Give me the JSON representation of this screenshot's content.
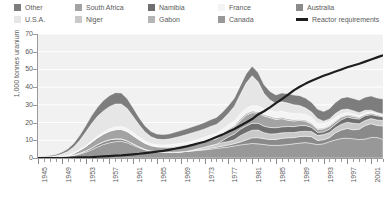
{
  "legend": {
    "entries": [
      {
        "label": "Other",
        "color": "#7d7d7d",
        "type": "swatch",
        "col": 0,
        "row": 0
      },
      {
        "label": "U.S.A.",
        "color": "#e6e6e6",
        "type": "swatch",
        "col": 0,
        "row": 1
      },
      {
        "label": "South Africa",
        "color": "#a3a3a3",
        "type": "swatch",
        "col": 1,
        "row": 0
      },
      {
        "label": "Niger",
        "color": "#c9c9c9",
        "type": "swatch",
        "col": 1,
        "row": 1
      },
      {
        "label": "Namibia",
        "color": "#6f6f6f",
        "type": "swatch",
        "col": 2,
        "row": 0
      },
      {
        "label": "Gabon",
        "color": "#b5b5b5",
        "type": "swatch",
        "col": 2,
        "row": 1
      },
      {
        "label": "France",
        "color": "#f4f4f4",
        "type": "swatch",
        "col": 3,
        "row": 0
      },
      {
        "label": "Canada",
        "color": "#989898",
        "type": "swatch",
        "col": 3,
        "row": 1
      },
      {
        "label": "Australia",
        "color": "#8a8a8a",
        "type": "swatch",
        "col": 4,
        "row": 0
      },
      {
        "label": "Reactor requirements",
        "color": "#1d1d1d",
        "type": "line",
        "col": 4,
        "row": 1
      }
    ]
  },
  "chart_data": {
    "type": "area",
    "title": "",
    "xlabel": "",
    "ylabel": "1,000 tonnes uranium",
    "stacked": true,
    "grid": true,
    "legend_position": "top",
    "xlim": [
      1945,
      2003
    ],
    "ylim": [
      0,
      70
    ],
    "yticks": [
      0,
      10,
      20,
      30,
      40,
      50,
      60,
      70
    ],
    "ytick_labels": [
      "0",
      "10",
      "20",
      "30",
      "40",
      "50",
      "60",
      "70"
    ],
    "xticks": [
      1945,
      1949,
      1953,
      1957,
      1961,
      1965,
      1969,
      1973,
      1977,
      1981,
      1985,
      1989,
      1993,
      1997,
      2001
    ],
    "xtick_labels": [
      "1945",
      "1949",
      "1953",
      "1957",
      "1961",
      "1965",
      "1969",
      "1973",
      "1977",
      "1981",
      "1985",
      "1989",
      "1993",
      "1997",
      "2001"
    ],
    "x": [
      1945,
      1946,
      1947,
      1948,
      1949,
      1950,
      1951,
      1952,
      1953,
      1954,
      1955,
      1956,
      1957,
      1958,
      1959,
      1960,
      1961,
      1962,
      1963,
      1964,
      1965,
      1966,
      1967,
      1968,
      1969,
      1970,
      1971,
      1972,
      1973,
      1974,
      1975,
      1976,
      1977,
      1978,
      1979,
      1980,
      1981,
      1982,
      1983,
      1984,
      1985,
      1986,
      1987,
      1988,
      1989,
      1990,
      1991,
      1992,
      1993,
      1994,
      1995,
      1996,
      1997,
      1998,
      1999,
      2000,
      2001,
      2002,
      2003
    ],
    "series": [
      {
        "name": "Canada",
        "color": "#989898",
        "values": [
          0.1,
          0.2,
          0.3,
          0.4,
          0.6,
          0.9,
          1.4,
          2.2,
          3.2,
          4.6,
          6.2,
          7.6,
          8.6,
          9.2,
          9.4,
          8.6,
          7.2,
          5.8,
          4.6,
          3.8,
          3.4,
          3.2,
          3.1,
          3.2,
          3.4,
          3.7,
          4.0,
          4.3,
          4.6,
          5.0,
          5.4,
          5.8,
          6.2,
          6.8,
          7.4,
          7.8,
          8.2,
          8.0,
          7.6,
          7.2,
          7.1,
          7.3,
          7.6,
          8.0,
          8.4,
          8.7,
          8.2,
          7.6,
          8.0,
          9.2,
          10.2,
          11.0,
          11.2,
          10.9,
          10.4,
          10.7,
          11.6,
          11.6,
          10.5
        ]
      },
      {
        "name": "Australia",
        "color": "#8a8a8a",
        "values": [
          0.0,
          0.0,
          0.0,
          0.0,
          0.1,
          0.2,
          0.3,
          0.5,
          0.8,
          1.1,
          1.4,
          1.6,
          1.7,
          1.6,
          1.4,
          1.1,
          0.8,
          0.5,
          0.3,
          0.2,
          0.1,
          0.1,
          0.1,
          0.1,
          0.1,
          0.1,
          0.1,
          0.2,
          0.3,
          0.5,
          0.7,
          0.9,
          1.1,
          1.3,
          1.6,
          2.4,
          3.2,
          3.5,
          3.3,
          3.2,
          3.4,
          3.8,
          3.8,
          3.5,
          3.7,
          3.6,
          3.8,
          2.3,
          2.3,
          2.3,
          4.0,
          4.8,
          5.5,
          5.0,
          5.9,
          7.6,
          7.8,
          6.8,
          7.6
        ]
      },
      {
        "name": "Niger",
        "color": "#c9c9c9",
        "values": [
          0,
          0,
          0,
          0,
          0,
          0,
          0,
          0,
          0,
          0,
          0,
          0,
          0,
          0,
          0,
          0,
          0,
          0,
          0,
          0,
          0,
          0,
          0,
          0,
          0,
          0,
          0.4,
          0.8,
          1.2,
          1.5,
          1.7,
          2.1,
          2.0,
          2.2,
          3.6,
          4.1,
          4.3,
          4.3,
          3.4,
          3.2,
          3.2,
          3.1,
          3.0,
          2.9,
          2.8,
          2.8,
          2.9,
          2.9,
          2.9,
          2.9,
          2.9,
          3.3,
          3.5,
          3.7,
          3.0,
          2.9,
          2.9,
          3.1,
          3.1
        ]
      },
      {
        "name": "Namibia",
        "color": "#6f6f6f",
        "values": [
          0,
          0,
          0,
          0,
          0,
          0,
          0,
          0,
          0,
          0,
          0,
          0,
          0,
          0,
          0,
          0,
          0,
          0,
          0,
          0,
          0,
          0,
          0,
          0,
          0,
          0,
          0,
          0,
          0,
          0,
          0,
          1.0,
          2.6,
          3.2,
          3.6,
          3.8,
          3.9,
          3.8,
          3.7,
          3.6,
          3.4,
          3.4,
          3.4,
          3.3,
          3.4,
          3.2,
          2.4,
          1.7,
          1.5,
          1.9,
          2.0,
          2.5,
          2.9,
          2.8,
          2.7,
          2.7,
          2.2,
          2.3,
          2.0
        ]
      },
      {
        "name": "South Africa",
        "color": "#a3a3a3",
        "values": [
          0,
          0,
          0,
          0,
          0,
          0.2,
          0.8,
          1.6,
          2.4,
          3.2,
          3.8,
          4.3,
          4.8,
          5.2,
          5.4,
          5.2,
          4.6,
          4.0,
          3.4,
          3.0,
          2.8,
          2.8,
          2.8,
          2.9,
          3.0,
          3.1,
          3.2,
          3.2,
          3.2,
          3.1,
          3.0,
          3.2,
          3.4,
          3.9,
          4.8,
          6.1,
          6.0,
          5.8,
          5.7,
          5.6,
          4.6,
          4.6,
          3.5,
          3.2,
          2.9,
          2.5,
          1.8,
          1.7,
          1.7,
          1.6,
          1.4,
          1.4,
          1.1,
          1.0,
          0.9,
          0.8,
          0.9,
          0.8,
          0.7
        ]
      },
      {
        "name": "Gabon",
        "color": "#b5b5b5",
        "values": [
          0,
          0,
          0,
          0,
          0,
          0,
          0,
          0,
          0,
          0,
          0,
          0,
          0,
          0,
          0,
          0,
          0,
          0,
          0,
          0,
          0.1,
          0.2,
          0.4,
          0.5,
          0.5,
          0.5,
          0.5,
          0.5,
          0.6,
          0.8,
          0.9,
          0.9,
          1.0,
          1.0,
          1.1,
          1.0,
          1.0,
          0.9,
          0.9,
          0.9,
          0.9,
          0.9,
          0.9,
          0.9,
          0.7,
          0.7,
          0.7,
          0.6,
          0.6,
          0.6,
          0.6,
          0.5,
          0.5,
          0.7,
          0.3,
          0.2,
          0.2,
          0.0,
          0.0
        ]
      },
      {
        "name": "France",
        "color": "#f4f4f4",
        "values": [
          0,
          0,
          0,
          0,
          0.1,
          0.2,
          0.3,
          0.4,
          0.5,
          0.7,
          0.9,
          1.1,
          1.3,
          1.5,
          1.7,
          1.8,
          1.8,
          1.6,
          1.4,
          1.2,
          1.1,
          1.1,
          1.1,
          1.2,
          1.3,
          1.4,
          1.5,
          1.7,
          1.9,
          2.1,
          2.2,
          2.3,
          2.4,
          2.5,
          2.7,
          2.9,
          3.0,
          3.1,
          3.2,
          3.3,
          3.4,
          3.4,
          3.4,
          3.3,
          3.2,
          3.1,
          3.0,
          2.8,
          2.5,
          2.1,
          1.7,
          1.3,
          1.0,
          0.8,
          0.6,
          0.5,
          0.4,
          0.2,
          0.2
        ]
      },
      {
        "name": "U.S.A.",
        "color": "#e6e6e6",
        "values": [
          0.3,
          0.4,
          0.6,
          0.9,
          1.4,
          2.2,
          3.4,
          5.2,
          7.6,
          9.8,
          11.2,
          12.0,
          12.6,
          13.0,
          12.6,
          11.2,
          9.0,
          6.8,
          5.0,
          3.8,
          3.2,
          3.0,
          3.2,
          3.6,
          4.0,
          4.4,
          4.6,
          4.6,
          4.6,
          4.8,
          5.0,
          5.4,
          6.4,
          8.2,
          11.0,
          14.2,
          16.8,
          13.6,
          8.6,
          5.8,
          4.8,
          5.2,
          5.4,
          5.0,
          4.5,
          3.6,
          3.2,
          2.7,
          1.3,
          1.4,
          2.3,
          2.4,
          2.0,
          1.8,
          1.8,
          1.5,
          1.0,
          0.9,
          0.8
        ]
      },
      {
        "name": "Other",
        "color": "#7d7d7d",
        "values": [
          0.2,
          0.3,
          0.5,
          0.7,
          1.0,
          1.4,
          2.0,
          2.8,
          3.6,
          4.4,
          5.2,
          5.8,
          6.2,
          6.4,
          6.2,
          5.6,
          4.8,
          4.0,
          3.4,
          3.0,
          2.8,
          2.8,
          2.9,
          3.0,
          3.2,
          3.3,
          3.4,
          3.5,
          3.6,
          3.8,
          4.0,
          4.2,
          4.4,
          4.6,
          4.9,
          5.2,
          5.4,
          5.2,
          5.0,
          4.8,
          4.8,
          5.0,
          5.2,
          5.4,
          5.6,
          5.6,
          5.4,
          5.2,
          5.4,
          5.8,
          6.2,
          6.6,
          6.8,
          6.9,
          7.0,
          7.4,
          8.0,
          8.2,
          8.4
        ]
      }
    ],
    "overlay_line": {
      "name": "Reactor requirements",
      "color": "#1d1d1d",
      "width": 2.2,
      "values": [
        0.0,
        0.0,
        0.0,
        0.0,
        0.0,
        0.1,
        0.2,
        0.3,
        0.4,
        0.5,
        0.7,
        0.9,
        1.1,
        1.3,
        1.5,
        1.8,
        2.1,
        2.4,
        2.8,
        3.2,
        3.6,
        4.0,
        4.6,
        5.2,
        5.9,
        6.6,
        7.4,
        8.3,
        9.2,
        10.4,
        11.8,
        13.2,
        14.8,
        16.4,
        18.2,
        20.0,
        22.0,
        24.6,
        26.4,
        28.6,
        31.0,
        33.2,
        35.6,
        38.2,
        40.2,
        42.0,
        43.6,
        45.0,
        46.4,
        47.6,
        48.8,
        50.0,
        51.2,
        52.2,
        53.2,
        54.4,
        55.6,
        56.8,
        58.0
      ]
    }
  }
}
